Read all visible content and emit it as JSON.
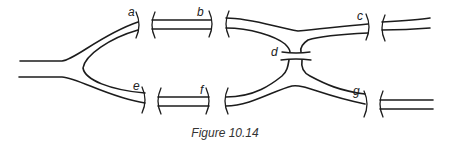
{
  "figure": {
    "caption": "Figure 10.14",
    "labels": {
      "a": "a",
      "b": "b",
      "c": "c",
      "d": "d",
      "e": "e",
      "f": "f",
      "g": "g"
    }
  },
  "colors": {
    "line": "#1c1c1c",
    "background": "#ffffff"
  }
}
